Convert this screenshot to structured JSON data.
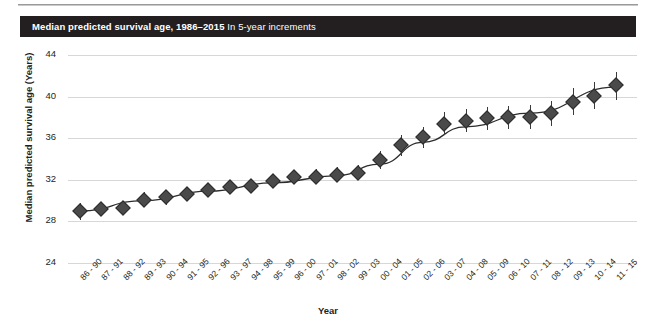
{
  "header": {
    "title_bold": "Median predicted survival age, 1986–2015",
    "title_regular": "In 5-year increments"
  },
  "colors": {
    "title_bar_bg": "#231f20",
    "title_bar_text": "#ffffff",
    "marker": "#4a4a4a",
    "trend_line": "#2c2c2c",
    "gridline": "#d7d7d7",
    "page_bg": "#ffffff"
  },
  "chart_data": {
    "type": "scatter",
    "title": "Median predicted survival age, 1986–2015",
    "subtitle": "In 5-year increments",
    "xlabel": "Year",
    "ylabel": "Median predicted survival age (Years)",
    "ylim": [
      24,
      44
    ],
    "yticks": [
      24,
      28,
      32,
      36,
      40,
      44
    ],
    "grid": "horizontal",
    "legend": "none",
    "error_bars": "vertical 95% interval",
    "categories": [
      "86 - 90",
      "87 - 91",
      "88 - 92",
      "89 - 93",
      "90 - 94",
      "91 - 95",
      "92 - 96",
      "93 - 97",
      "94 - 98",
      "95 - 99",
      "96 - 00",
      "97 - 01",
      "98 - 02",
      "99 - 03",
      "00 - 04",
      "01 - 05",
      "02 - 06",
      "03 - 07",
      "04 - 08",
      "05 - 09",
      "06 - 10",
      "07 - 11",
      "08 - 12",
      "09 - 13",
      "10 - 14",
      "11 - 15"
    ],
    "values": [
      29.0,
      29.2,
      29.3,
      30.1,
      30.3,
      30.6,
      31.0,
      31.3,
      31.4,
      31.9,
      32.3,
      32.3,
      32.5,
      32.7,
      33.9,
      35.3,
      36.1,
      37.4,
      37.7,
      37.9,
      38.0,
      38.0,
      38.4,
      39.5,
      40.1,
      41.1
    ],
    "err_low": [
      28.1,
      28.5,
      28.6,
      29.4,
      29.6,
      30.0,
      30.4,
      30.7,
      30.8,
      31.3,
      31.7,
      31.6,
      31.8,
      32.0,
      33.0,
      34.3,
      35.1,
      36.3,
      36.6,
      36.8,
      36.9,
      36.9,
      37.2,
      38.2,
      38.8,
      39.7
    ],
    "err_high": [
      29.8,
      29.9,
      30.0,
      30.8,
      31.0,
      31.2,
      31.6,
      31.9,
      32.0,
      32.5,
      32.9,
      33.0,
      33.2,
      33.4,
      34.8,
      36.3,
      37.1,
      38.5,
      38.8,
      39.0,
      39.1,
      39.2,
      39.6,
      40.8,
      41.4,
      42.4
    ],
    "trend_line": {
      "description": "fitted smooth curve through the medians",
      "points": [
        [
          0,
          29.0
        ],
        [
          3,
          30.0
        ],
        [
          6,
          30.9
        ],
        [
          9,
          31.7
        ],
        [
          12,
          32.4
        ],
        [
          14,
          33.5
        ],
        [
          16,
          35.6
        ],
        [
          18,
          37.1
        ],
        [
          21,
          38.4
        ],
        [
          25,
          40.9
        ]
      ]
    }
  }
}
